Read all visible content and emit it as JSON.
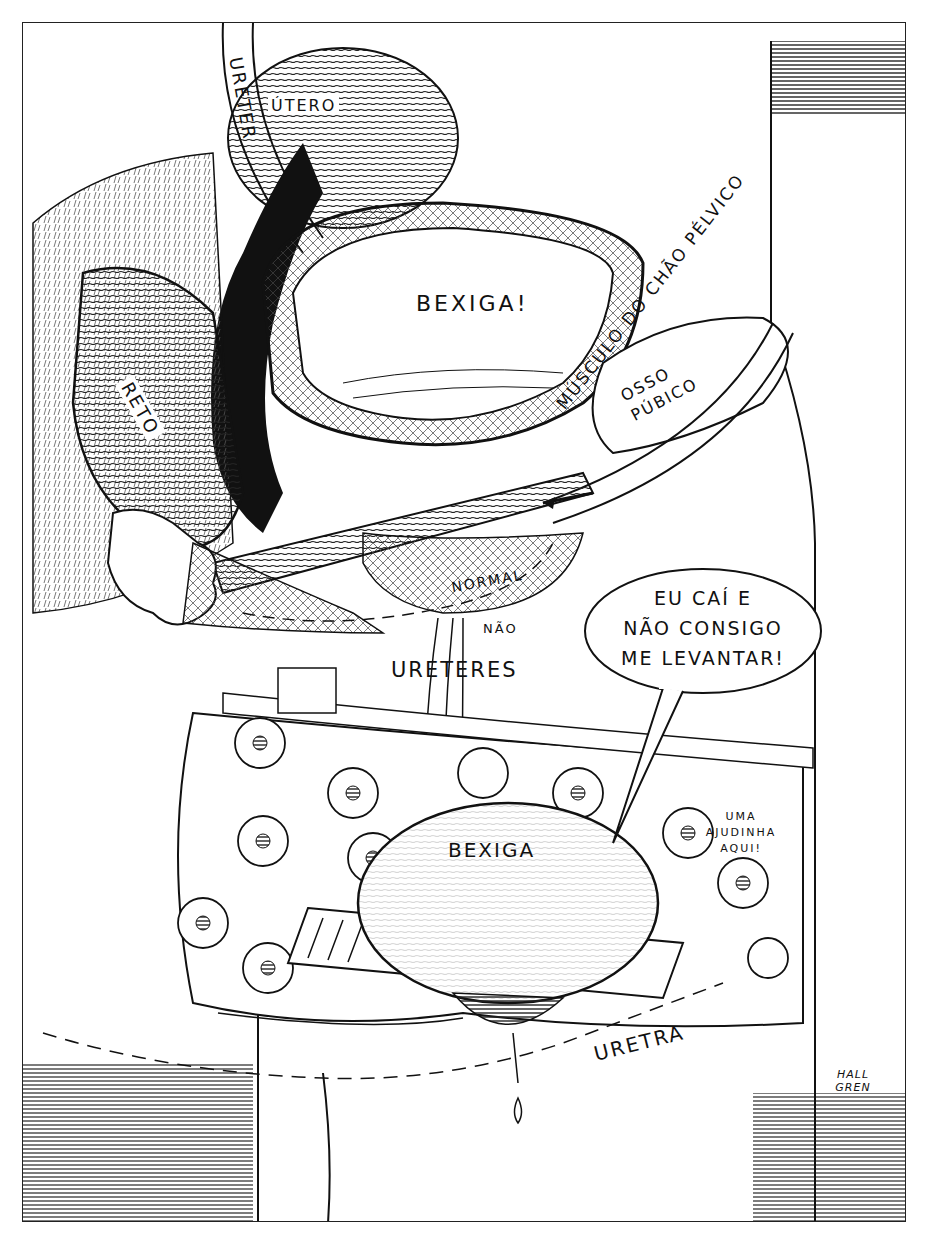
{
  "illustration": {
    "title": "Ilustração anatômica: bexiga normal vs. bexiga caída",
    "labels": {
      "ureter": "URETER",
      "utero": "ÚTERO",
      "bexiga_top": "BEXIGA!",
      "reto": "RETO",
      "osso_pubico_line1": "OSSO",
      "osso_pubico_line2": "PÚBICO",
      "musculo": "MÚSCULO DO CHÃO PÉLVICO",
      "normal": "NORMAL",
      "nao": "NÃO",
      "ureteres": "URETERES",
      "bexiga_bottom": "BEXIGA",
      "uretra": "URETRA"
    },
    "speech_bubble": {
      "lines": [
        "EU CAÍ E",
        "NÃO CONSIGO",
        "ME LEVANTAR!"
      ]
    },
    "small_speech": {
      "lines": [
        "UMA",
        "AJUDINHA",
        "AQUI!"
      ]
    },
    "signature": {
      "lines": [
        "HALL",
        "GREN"
      ]
    },
    "colors": {
      "ink": "#111111",
      "paper": "#ffffff",
      "hatch": "#333333"
    }
  }
}
